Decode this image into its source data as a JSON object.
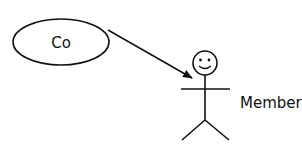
{
  "diagram": {
    "type": "use-case",
    "use_case": {
      "label": "Co"
    },
    "actor": {
      "label": "Member",
      "icon": "stick-figure-smiley"
    },
    "association": {
      "from": "Co",
      "to": "Member",
      "style": "arrow"
    }
  },
  "colors": {
    "stroke": "#111111",
    "background": "#ffffff"
  }
}
